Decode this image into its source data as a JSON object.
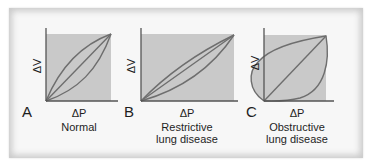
{
  "figure": {
    "colors": {
      "background": "#f7f7f7",
      "shaded_area": "#c9c9c9",
      "axis": "#555555",
      "curve": "#6e6e6e",
      "text": "#1e1e1e"
    },
    "panels": [
      {
        "letter": "A",
        "x_axis_label": "ΔP",
        "y_axis_label": "ΔV",
        "caption_line1": "Normal",
        "caption_line2": ""
      },
      {
        "letter": "B",
        "x_axis_label": "ΔP",
        "y_axis_label": "ΔV",
        "caption_line1": "Restrictive",
        "caption_line2": "lung disease"
      },
      {
        "letter": "C",
        "x_axis_label": "ΔP",
        "y_axis_label": "ΔV",
        "caption_line1": "Obstructive",
        "caption_line2": "lung disease"
      }
    ]
  }
}
